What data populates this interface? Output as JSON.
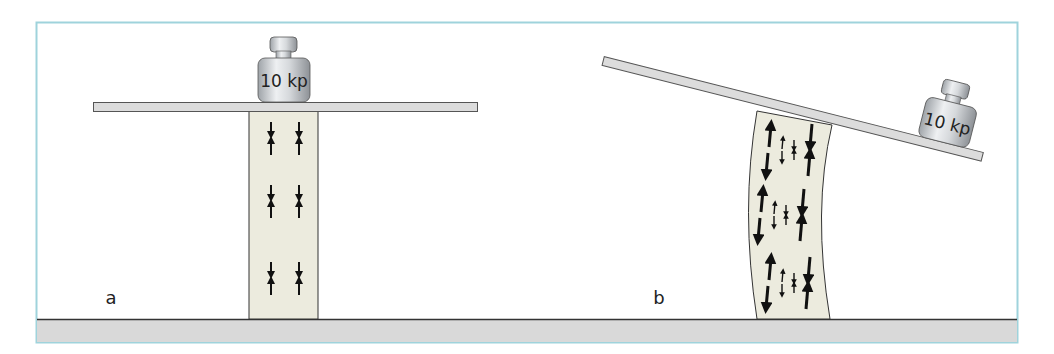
{
  "figure": {
    "colors": {
      "frame": "#9fd3dc",
      "ground": "#d9d9d9",
      "plank": "#dcdcdc",
      "column": "#ecebde",
      "outline": "#333333",
      "arrow": "#111111"
    },
    "panels": [
      {
        "id": "a",
        "label": "a",
        "weight_label": "10 kp",
        "description": "Weight centered on plank; column under uniform compression",
        "arrow_rows": 3,
        "arrow_columns": 2,
        "stress": "compression"
      },
      {
        "id": "b",
        "label": "b",
        "weight_label": "10 kp",
        "description": "Weight at end of tilted plank; column bends with tension on left and compression on right",
        "arrow_rows": 3,
        "stress_left": "tension",
        "stress_right": "compression"
      }
    ]
  }
}
